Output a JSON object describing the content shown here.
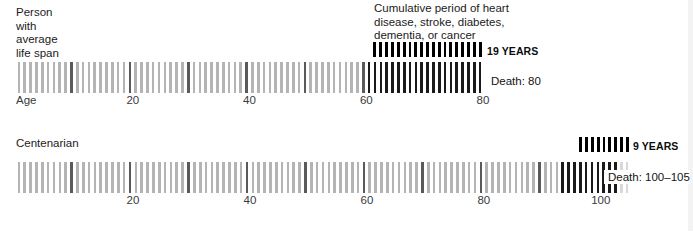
{
  "panels": [
    {
      "title": "Person\nwith\naverage\nlife span",
      "axis_name": "Age",
      "death_label": "Death: 80",
      "bracket_label": "19 YEARS"
    },
    {
      "title": "Centenarian",
      "death_label": "Death: 100–105",
      "bracket_label": "9 YEARS"
    }
  ],
  "annotation": {
    "text": "Cumulative period of heart\ndisease, stroke, diabetes,\ndementia, or cancer"
  },
  "colors": {
    "tick_light": "#b4b4b4",
    "tick_decade": "#5a5a5a",
    "tick_dark": "#1a1a1a",
    "bracket": "#000000",
    "background": "#ffffff",
    "text": "#1a1a1a",
    "axis_text": "#3a3a3a"
  },
  "chart_data": {
    "type": "bar",
    "xlabel": "Age",
    "ylabel": "",
    "grid": false,
    "legend": "none",
    "series": [
      {
        "name": "Person with average life span",
        "xlim": [
          0,
          80
        ],
        "death_age": 80,
        "death_label": "Death: 80",
        "disease_period_years": 19,
        "disease_period_label": "19 YEARS",
        "disease_period_start_age": 61,
        "disease_period_end_age": 80,
        "tick_interval_years": 1,
        "decade_ticks": [
          10,
          20,
          30,
          40,
          50,
          60,
          70,
          80
        ],
        "axis_ticks": [
          20,
          40,
          60,
          80
        ]
      },
      {
        "name": "Centenarian",
        "xlim": [
          0,
          105
        ],
        "death_age": 102.5,
        "death_label": "Death: 100–105",
        "disease_period_years": 9,
        "disease_period_label": "9 YEARS",
        "disease_period_start_age": 94,
        "disease_period_end_age": 103,
        "tick_interval_years": 1,
        "decade_ticks": [
          10,
          20,
          30,
          40,
          50,
          60,
          70,
          80,
          90,
          100
        ],
        "axis_ticks": [
          20,
          40,
          60,
          80,
          100
        ]
      }
    ],
    "annotation": "Cumulative period of heart disease, stroke, diabetes, dementia, or cancer"
  }
}
